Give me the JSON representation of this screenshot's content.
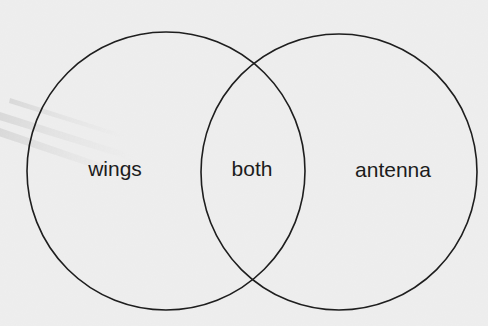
{
  "diagram": {
    "type": "venn",
    "sets": [
      {
        "name": "wings",
        "label": "wings"
      },
      {
        "name": "antenna",
        "label": "antenna"
      }
    ],
    "intersection": {
      "label": "both"
    }
  },
  "colors": {
    "background": "#ececec",
    "stroke": "#1e1e1e",
    "text": "#1c1c1c"
  }
}
